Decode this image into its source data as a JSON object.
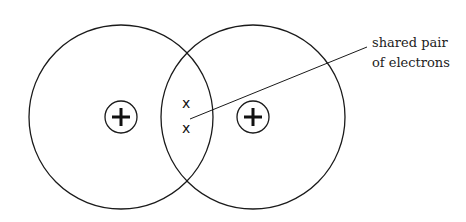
{
  "diagram": {
    "atoms": [
      {
        "id": "left-atom",
        "shell_center": [
          121,
          117
        ],
        "shell_radius": 92,
        "nucleus_radius": 16,
        "nucleus_symbol": "+"
      },
      {
        "id": "right-atom",
        "shell_center": [
          253,
          117
        ],
        "shell_radius": 92,
        "nucleus_radius": 16,
        "nucleus_symbol": "+"
      }
    ],
    "electrons": [
      {
        "symbol": "x",
        "pos": [
          187,
          103
        ]
      },
      {
        "symbol": "x",
        "pos": [
          187,
          128
        ]
      }
    ],
    "label": {
      "line1": "shared pair",
      "line2": "of electrons",
      "leader_from": [
        190,
        119
      ],
      "leader_to": [
        367,
        47
      ]
    },
    "colors": {
      "stroke": "#1a1a1a",
      "background": "#ffffff"
    }
  }
}
